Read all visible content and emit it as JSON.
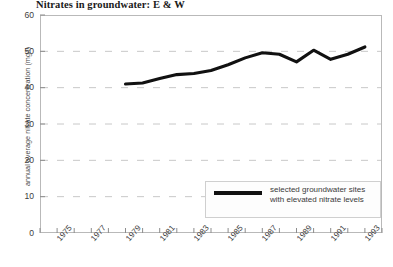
{
  "chart_data": {
    "type": "line",
    "title": "Nitrates in groundwater: E & W",
    "xlabel": "",
    "ylabel": "annual average nitrate concentration (mg/l)",
    "ylim": [
      0,
      60
    ],
    "xlim": [
      1974,
      1994
    ],
    "yticks": [
      0,
      10,
      20,
      30,
      40,
      50,
      60
    ],
    "ytick_labels": [
      "0",
      "10",
      "20",
      "30",
      "40",
      "50",
      "60"
    ],
    "xticks": [
      1974,
      1975,
      1976,
      1977,
      1978,
      1979,
      1980,
      1981,
      1982,
      1983,
      1984,
      1985,
      1986,
      1987,
      1988,
      1989,
      1990,
      1991,
      1992,
      1993,
      1994
    ],
    "xtick_labels": [
      "1975",
      "1977",
      "1979",
      "1981",
      "1983",
      "1985",
      "1987",
      "1989",
      "1991",
      "1993"
    ],
    "xtick_label_years": [
      1975,
      1977,
      1979,
      1981,
      1983,
      1985,
      1987,
      1989,
      1991,
      1993
    ],
    "grid": "horizontal-dashed",
    "legend_position": "lower-right-inside",
    "line_color": "#111111",
    "grid_color": "#c8c8c8",
    "axis_color": "#b9b9b9",
    "series": [
      {
        "name": "selected groundwater sites with elevated nitrate levels",
        "x": [
          1979,
          1980,
          1981,
          1982,
          1983,
          1984,
          1985,
          1986,
          1987,
          1988,
          1989,
          1990,
          1991,
          1992,
          1993
        ],
        "values": [
          41.0,
          41.3,
          42.5,
          43.6,
          43.9,
          44.7,
          46.3,
          48.2,
          49.6,
          49.2,
          47.1,
          50.3,
          47.8,
          49.2,
          51.2
        ]
      }
    ]
  },
  "legend": {
    "entry_label": "selected groundwater sites with elevated nitrate levels"
  }
}
